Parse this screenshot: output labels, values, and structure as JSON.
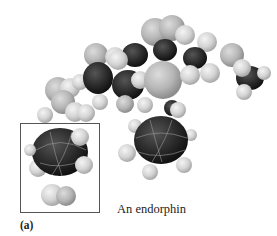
{
  "figure": {
    "caption": "An endorphin",
    "panel_label": "(a)",
    "highlight_box": true,
    "colors": {
      "carbon": "#2a2a2a",
      "hydrogen": "#d6d6d6",
      "heteroatom": "#b8b8b8",
      "box_border": "#555555",
      "background": "#ffffff"
    }
  }
}
